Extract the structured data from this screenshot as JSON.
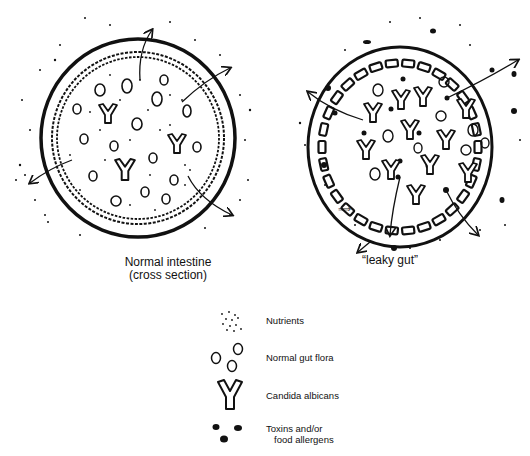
{
  "figure": {
    "panels": [
      {
        "id": "normal",
        "caption_line1": "Normal intestine",
        "caption_line2": "(cross section)"
      },
      {
        "id": "leaky",
        "caption": "“leaky gut”"
      }
    ],
    "legend": {
      "items": [
        {
          "symbol": "nutrients-dots",
          "label": "Nutrients"
        },
        {
          "symbol": "ovals",
          "label": "Normal gut flora"
        },
        {
          "symbol": "y-shape",
          "label": "Candida albicans"
        },
        {
          "symbol": "black-blobs",
          "label_line1": "Toxins and/or",
          "label_line2": "food allergens"
        }
      ]
    },
    "colors": {
      "ink": "#111111",
      "background": "#ffffff"
    }
  }
}
